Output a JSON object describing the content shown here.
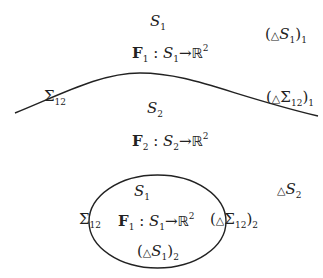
{
  "diagram": {
    "stroke_color": "#222222",
    "background": "#ffffff",
    "curve": {
      "name": "interface-curve",
      "path": "M 15 113 C 60 95, 100 73, 140 73 C 190 73, 230 95, 318 116"
    },
    "ellipse": {
      "cx": 157.5,
      "cy": 221.5,
      "rx": 68.5,
      "ry": 46.5
    },
    "labels": {
      "s1_top": {
        "base": "S",
        "sub": "1"
      },
      "f1_top": {
        "F": "F",
        "Fsub": "1",
        "colon": ":",
        "S": "S",
        "Ssub": "1",
        "arrow": "→",
        "R": "ℝ",
        "Rsup": "2"
      },
      "delta_s1_1": {
        "open": "(",
        "tri": "△",
        "base": "S",
        "sub": "1",
        "close": ")",
        "outer_sub": "1"
      },
      "sigma12_left": {
        "base": "Σ",
        "sub": "12"
      },
      "delta_sigma12_1": {
        "open": "(",
        "tri": "△",
        "base": "Σ",
        "sub": "12",
        "close": ")",
        "outer_sub": "1"
      },
      "s2_mid": {
        "base": "S",
        "sub": "2"
      },
      "f2_mid": {
        "F": "F",
        "Fsub": "2",
        "colon": ":",
        "S": "S",
        "Ssub": "2",
        "arrow": "→",
        "R": "ℝ",
        "Rsup": "2"
      },
      "s1_ellipse": {
        "base": "S",
        "sub": "1"
      },
      "sigma12_ellipse": {
        "base": "Σ",
        "sub": "12"
      },
      "f1_ellipse": {
        "F": "F",
        "Fsub": "1",
        "colon": ":",
        "S": "S",
        "Ssub": "1",
        "arrow": "→",
        "R": "ℝ",
        "Rsup": "2"
      },
      "delta_sigma12_2": {
        "open": "(",
        "tri": "△",
        "base": "Σ",
        "sub": "12",
        "close": ")",
        "outer_sub": "2"
      },
      "delta_s1_2": {
        "open": "(",
        "tri": "△",
        "base": "S",
        "sub": "1",
        "close": ")",
        "outer_sub": "2"
      },
      "delta_s2": {
        "tri": "△",
        "base": "S",
        "sub": "2"
      }
    }
  }
}
